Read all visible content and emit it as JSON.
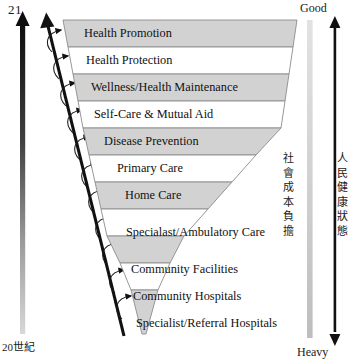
{
  "diagram": {
    "era_top": "21",
    "era_bottom": "20世紀",
    "right_top_label": "Good",
    "right_bottom_label": "Heavy",
    "cost_axis_label": "社會成本負擔",
    "health_axis_label": "人民健康狀態",
    "colors": {
      "band_gray": "#d2d2d2",
      "band_white": "#ffffff",
      "band_border": "#8c8c8c",
      "arrow_black": "#111111",
      "text": "#111111"
    },
    "bands": [
      {
        "label": "Health Promotion",
        "fill": "gray"
      },
      {
        "label": "Health Protection",
        "fill": "white"
      },
      {
        "label": "Wellness/Health Maintenance",
        "fill": "gray"
      },
      {
        "label": "Self-Care & Mutual Aid",
        "fill": "white"
      },
      {
        "label": "Disease Prevention",
        "fill": "gray"
      },
      {
        "label": "Primary Care",
        "fill": "white"
      },
      {
        "label": "Home Care",
        "fill": "gray"
      },
      {
        "label": "Specialast/Ambulatory Care",
        "fill": "white"
      },
      {
        "label": "Community Facilities",
        "fill": "gray"
      },
      {
        "label": "Community Hospitals",
        "fill": "white"
      },
      {
        "label": "Specialist/Referral Hospitals",
        "fill": "gray"
      }
    ]
  }
}
